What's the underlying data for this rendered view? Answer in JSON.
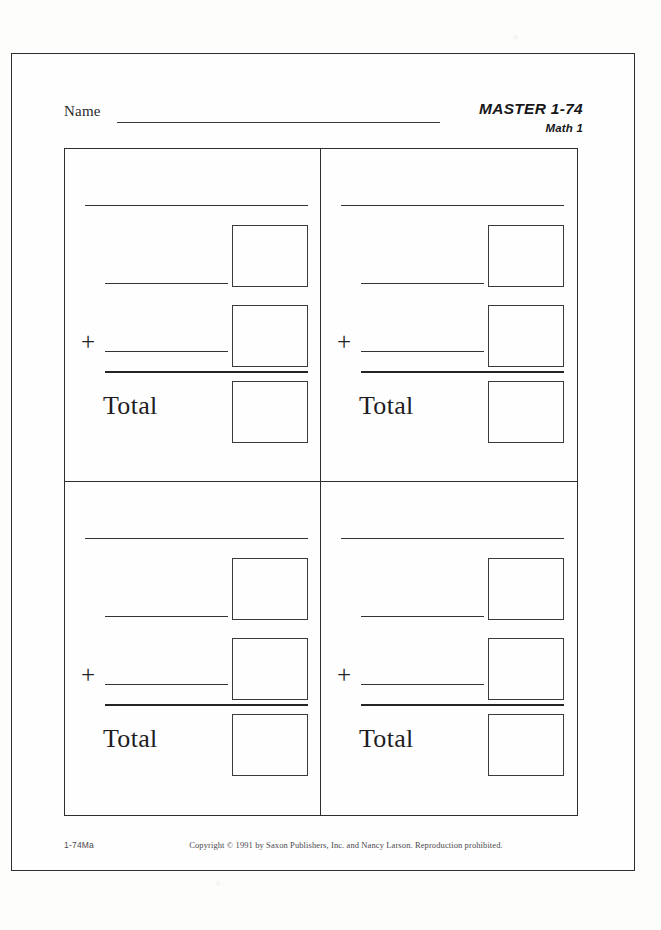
{
  "page": {
    "header": {
      "name_label": "Name",
      "master_title": "MASTER 1-74",
      "master_subtitle": "Math 1"
    },
    "problems": [
      {
        "plus_sign": "+",
        "total_label": "Total"
      },
      {
        "plus_sign": "+",
        "total_label": "Total"
      },
      {
        "plus_sign": "+",
        "total_label": "Total"
      },
      {
        "plus_sign": "+",
        "total_label": "Total"
      }
    ],
    "footer": {
      "code": "1-74Ma",
      "copyright": "Copyright © 1991 by Saxon Publishers, Inc. and Nancy Larson. Reproduction prohibited."
    },
    "colors": {
      "ink": "#2e2e30",
      "paper": "#fefefe",
      "scan_background": "#fdfdfc"
    }
  }
}
